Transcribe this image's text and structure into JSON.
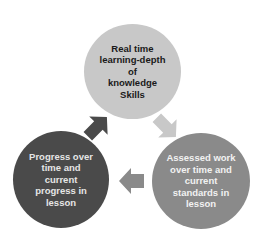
{
  "diagram": {
    "type": "cycle",
    "nodes": [
      {
        "id": "top",
        "label": "Real time learning-depth of knowledge Skills",
        "lines": [
          "Real time",
          "learning-depth",
          "of",
          "knowledge",
          "Skills"
        ],
        "fill": "#c8c8c8",
        "text_color": "#1a1a1a"
      },
      {
        "id": "right",
        "label": "Assessed work over time and current standards in lesson",
        "lines": [
          "Assessed work",
          "over time and",
          "current",
          "standards in",
          "lesson"
        ],
        "fill": "#8a8a8a",
        "text_color": "#f2f2f2"
      },
      {
        "id": "left",
        "label": "Progress over time and current progress in lesson",
        "lines": [
          "Progress over",
          "time and",
          "current",
          "progress in",
          "lesson"
        ],
        "fill": "#4a4a4a",
        "text_color": "#e6e6e6"
      }
    ],
    "arrows": [
      {
        "from": "top",
        "to": "right",
        "fill": "#c8c8c8"
      },
      {
        "from": "right",
        "to": "left",
        "fill": "#8a8a8a"
      },
      {
        "from": "left",
        "to": "top",
        "fill": "#4a4a4a"
      }
    ]
  }
}
